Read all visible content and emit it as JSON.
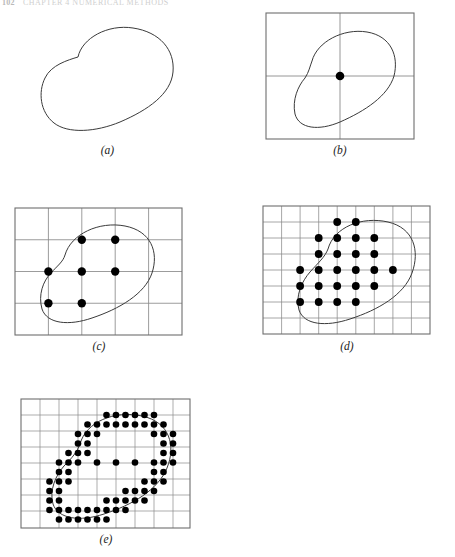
{
  "header": {
    "page_number": "102",
    "chapter_title": "CHAPTER 4  NUMERICAL METHODS"
  },
  "figure": {
    "panels": [
      {
        "id": "a",
        "label": "(a)",
        "caption_text": "(a)",
        "grid_cols": 0,
        "grid_rows": 0,
        "dot_count": 0,
        "has_frame": false
      },
      {
        "id": "b",
        "label": "(b)",
        "caption_text": "(b)",
        "grid_cols": 2,
        "grid_rows": 2,
        "dot_count": 1,
        "has_frame": true
      },
      {
        "id": "c",
        "label": "(c)",
        "caption_text": "(c)",
        "grid_cols": 5,
        "grid_rows": 4,
        "dot_count": 7,
        "has_frame": true
      },
      {
        "id": "d",
        "label": "(d)",
        "caption_text": "(d)",
        "grid_cols": 9,
        "grid_rows": 8,
        "dot_count": 25,
        "has_frame": true
      },
      {
        "id": "e",
        "label": "(e)",
        "caption_text": "(e)",
        "grid_cols": 9,
        "grid_rows": 8,
        "dot_count": 118,
        "has_frame": true
      }
    ]
  },
  "colors": {
    "curve": "#3a3a3a",
    "grid": "#8a8a8a",
    "frame": "#6e6e6e",
    "dot": "#000000",
    "background": "#ffffff",
    "label_text": "#1a1a1a"
  },
  "chart_data": {
    "type": "scatter",
    "xlabel": "",
    "ylabel": "",
    "panels": [
      {
        "id": "a",
        "description": "Smooth closed blob outline, no grid, no sample points",
        "grid": {
          "visible": false,
          "cols": 0,
          "rows": 0
        },
        "points": []
      },
      {
        "id": "b",
        "description": "Coarse 2x2 grid over the blob; one interior grid node sampled",
        "grid": {
          "visible": true,
          "cols": 2,
          "rows": 2
        },
        "points": [
          [
            1,
            1
          ]
        ]
      },
      {
        "id": "c",
        "description": "5x4 grid; seven interior grid nodes fall inside the blob",
        "grid": {
          "visible": true,
          "cols": 5,
          "rows": 4
        },
        "points": [
          [
            2,
            3
          ],
          [
            3,
            3
          ],
          [
            1,
            2
          ],
          [
            2,
            2
          ],
          [
            3,
            2
          ],
          [
            1,
            1
          ],
          [
            2,
            1
          ]
        ]
      },
      {
        "id": "d",
        "description": "9x8 grid; twenty-five interior grid nodes fall inside the blob",
        "grid": {
          "visible": true,
          "cols": 9,
          "rows": 8
        },
        "points": [
          [
            4,
            7
          ],
          [
            5,
            7
          ],
          [
            3,
            6
          ],
          [
            4,
            6
          ],
          [
            5,
            6
          ],
          [
            6,
            6
          ],
          [
            3,
            5
          ],
          [
            4,
            5
          ],
          [
            5,
            5
          ],
          [
            6,
            5
          ],
          [
            1,
            4
          ],
          [
            2,
            4
          ],
          [
            3,
            4
          ],
          [
            4,
            4
          ],
          [
            5,
            4
          ],
          [
            6,
            4
          ],
          [
            1,
            3
          ],
          [
            2,
            3
          ],
          [
            3,
            3
          ],
          [
            4,
            3
          ],
          [
            5,
            3
          ],
          [
            1,
            2
          ],
          [
            2,
            2
          ],
          [
            3,
            2
          ],
          [
            4,
            2
          ]
        ]
      },
      {
        "id": "e",
        "description": "Fine sub-grid sampling; dense band of sample points traces the blob boundary with sparser interior nodes",
        "grid": {
          "visible": true,
          "cols": 9,
          "rows": 8
        },
        "point_count": 118,
        "pattern": "dense-boundary-band"
      }
    ],
    "legend": [],
    "grid_on": true
  }
}
